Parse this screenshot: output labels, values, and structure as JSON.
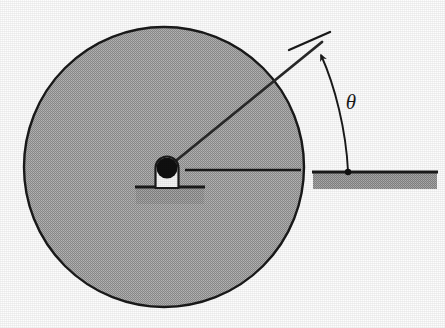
{
  "figure": {
    "background_color": "#fdfdfd",
    "labels": {
      "theta": "θ"
    },
    "colors": {
      "disk_fill": "#a8a8a8",
      "disk_stroke": "#1a1a1a",
      "ground_fill": "#9a9a9a",
      "ground_stroke": "#1a1a1a",
      "hub_fill": "#f2f2f2",
      "hub_stroke": "#1a1a1a",
      "axle_fill": "#111111",
      "line_stroke": "#1a1a1a"
    },
    "geometry": {
      "disk": {
        "cx": 164,
        "cy": 167,
        "r": 140
      },
      "hub": {
        "cx": 166,
        "cy": 168,
        "axle_r": 11
      },
      "spoke": {
        "x1": 166,
        "y1": 168,
        "x2": 322,
        "y2": 42
      },
      "horizontal_reference": {
        "x1": 185,
        "y1": 170,
        "x2": 301,
        "y2": 170
      },
      "left_ground_bar": {
        "x": 136,
        "y": 186,
        "w": 68,
        "h": 18
      },
      "right_ground_bar": {
        "x": 313,
        "y": 171,
        "w": 124,
        "h": 18
      },
      "angle_arc": {
        "from_x": 320,
        "from_y": 55,
        "to_x": 348,
        "to_y": 171
      },
      "theta_label_pos": {
        "x": 351,
        "y": 109
      }
    }
  }
}
